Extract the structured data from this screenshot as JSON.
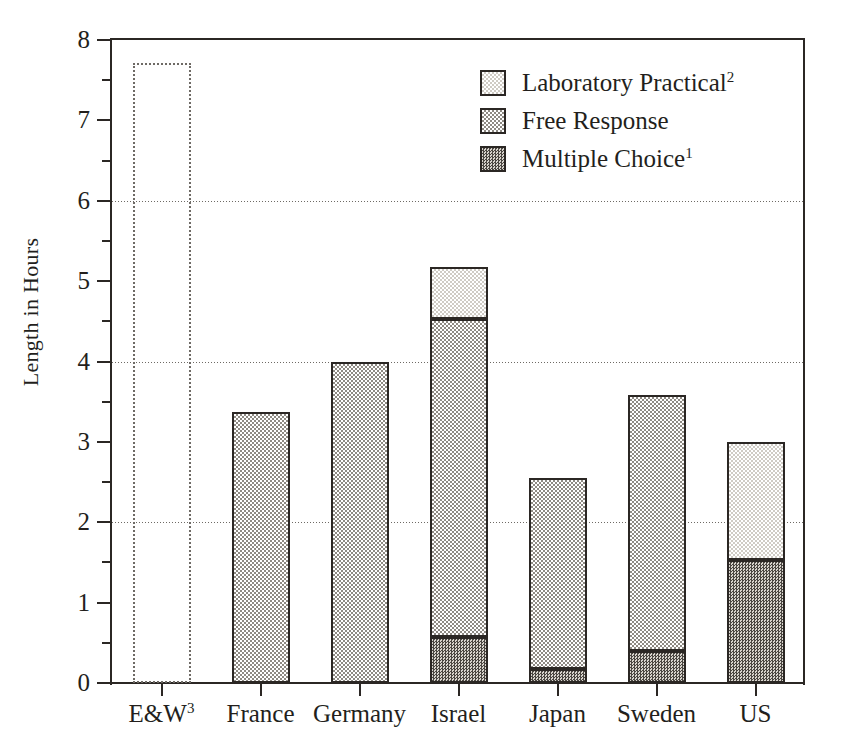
{
  "chart_data": {
    "type": "bar",
    "title": "",
    "subtitle": "",
    "xlabel": "",
    "ylabel": "Length in Hours",
    "ylim": [
      0,
      8
    ],
    "yticks": [
      0,
      1,
      2,
      3,
      4,
      5,
      6,
      7,
      8
    ],
    "ytick_labels": [
      "0",
      "1",
      "2",
      "3",
      "4",
      "5",
      "6",
      "7",
      "8"
    ],
    "yminor_ticks": [
      0.5,
      1.5,
      2.5,
      3.5,
      4.5,
      5.5,
      6.5,
      7.5
    ],
    "gridlines": [
      2,
      4,
      6
    ],
    "grid": true,
    "grid_style": "dotted",
    "legend_position": "top-right",
    "stacked": true,
    "categories": [
      "E&W",
      "France",
      "Germany",
      "Israel",
      "Japan",
      "Sweden",
      "US"
    ],
    "category_labels": [
      "E&W 3",
      "France",
      "Germany",
      "Israel",
      "Japan",
      "Sweden",
      "US"
    ],
    "category_footnotes": [
      "3",
      "",
      "",
      "",
      "",
      "",
      ""
    ],
    "series": [
      {
        "name": "Multiple Choice",
        "footnote": "1",
        "fill": "dark",
        "values": [
          0,
          0,
          0,
          0.57,
          0.18,
          0.4,
          1.53
        ]
      },
      {
        "name": "Free Response",
        "footnote": "",
        "fill": "medium",
        "values": [
          0,
          3.37,
          4.0,
          3.96,
          2.37,
          3.18,
          0
        ]
      },
      {
        "name": "Laboratory Practical",
        "footnote": "2",
        "fill": "light",
        "values": [
          0,
          0,
          0,
          0.64,
          0,
          0,
          1.47
        ]
      }
    ],
    "totals": [
      7.72,
      3.37,
      4.0,
      5.17,
      2.55,
      3.58,
      3.0
    ],
    "special_bars": [
      {
        "category": "E&W",
        "style": "dotted-outline-no-fill",
        "total": 7.72,
        "note": "open dotted box, no segment fill"
      }
    ]
  },
  "legend": {
    "items": [
      {
        "label": "Laboratory Practical",
        "footnote": "2",
        "fill": "light"
      },
      {
        "label": "Free Response",
        "footnote": "",
        "fill": "medium"
      },
      {
        "label": "Multiple Choice",
        "footnote": "1",
        "fill": "dark"
      }
    ]
  },
  "axis": {
    "y_title": "Length in Hours"
  },
  "colors": {
    "axis": "#2b2724",
    "text": "#231f1c",
    "grid": "#6e6a65",
    "fill_light": "#cfcbc4",
    "fill_medium": "#8e8a83",
    "fill_dark": "#4a4641",
    "background": "#ffffff"
  }
}
